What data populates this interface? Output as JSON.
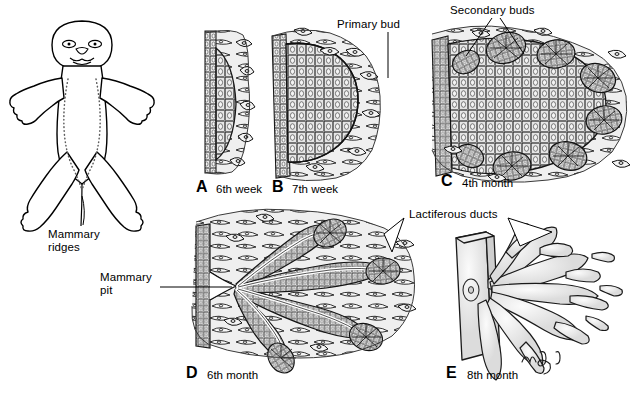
{
  "figure": {
    "signature": "m.g.",
    "panels": [
      {
        "id": "A",
        "letter": "A",
        "caption": "6th week",
        "stage": "mammary ridge epithelial thickening"
      },
      {
        "id": "B",
        "letter": "B",
        "caption": "7th week",
        "stage": "primary bud formation"
      },
      {
        "id": "C",
        "letter": "C",
        "caption": "4th month",
        "stage": "secondary bud formation"
      },
      {
        "id": "D",
        "letter": "D",
        "caption": "6th month",
        "stage": "canalization of lactiferous ducts"
      },
      {
        "id": "E",
        "letter": "E",
        "caption": "8th month",
        "stage": "branched lactiferous duct system"
      }
    ],
    "annotations": [
      {
        "id": "mammary-ridges",
        "text": "Mammary\nridges"
      },
      {
        "id": "primary-bud",
        "text": "Primary bud"
      },
      {
        "id": "secondary-buds",
        "text": "Secondary buds"
      },
      {
        "id": "mammary-pit",
        "text": "Mammary\npit"
      },
      {
        "id": "lactiferous-ducts",
        "text": "Lactiferous ducts"
      }
    ],
    "colors": {
      "line": "#000000",
      "tissue_fill": "#e8e8e8",
      "cell_fill": "#d8d8d8",
      "background": "#ffffff"
    }
  }
}
